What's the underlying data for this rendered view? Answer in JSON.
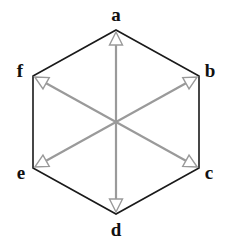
{
  "diagram": {
    "type": "hexagon-with-radial-arrows",
    "center": {
      "x": 116,
      "y": 122
    },
    "colors": {
      "edge": "#1a1a1a",
      "arrow": "#9a9a9a",
      "label": "#111111"
    },
    "vertices": [
      {
        "id": "a",
        "label": "a",
        "x": 116,
        "y": 30,
        "lx": 116,
        "ly": 21
      },
      {
        "id": "b",
        "label": "b",
        "x": 199,
        "y": 76,
        "lx": 210,
        "ly": 77
      },
      {
        "id": "c",
        "label": "c",
        "x": 199,
        "y": 168,
        "lx": 209,
        "ly": 179
      },
      {
        "id": "d",
        "label": "d",
        "x": 116,
        "y": 214,
        "lx": 116,
        "ly": 236
      },
      {
        "id": "e",
        "label": "e",
        "x": 33,
        "y": 168,
        "lx": 21,
        "ly": 179
      },
      {
        "id": "f",
        "label": "f",
        "x": 33,
        "y": 76,
        "lx": 20,
        "ly": 77
      }
    ],
    "arrows": [
      {
        "from": "center",
        "to": "a"
      },
      {
        "from": "center",
        "to": "b"
      },
      {
        "from": "center",
        "to": "c"
      },
      {
        "from": "center",
        "to": "d"
      },
      {
        "from": "center",
        "to": "e"
      },
      {
        "from": "center",
        "to": "f"
      }
    ]
  }
}
